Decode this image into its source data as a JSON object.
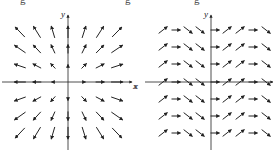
{
  "top_cut_text": [
    "g",
    "g",
    "g"
  ],
  "diagrams": [
    {
      "id": "left",
      "description": "Vector field radiating outward from origin",
      "field": "radial outward F(x,y) = (x, y)",
      "x_label": "x",
      "y_label": "y",
      "origin": [
        68,
        82
      ],
      "x_axis": [
        2,
        132
      ],
      "y_axis": [
        15,
        150
      ],
      "grid_x": [
        20,
        37,
        53,
        68,
        84,
        100,
        117
      ],
      "grid_y": [
        32,
        49,
        66,
        82,
        99,
        116,
        133
      ],
      "arrow_color": "#222222"
    },
    {
      "id": "right",
      "description": "Vector field with constant horizontal component, vertical component varying periodically with x",
      "field": "F(x,y) = (1, sin x)",
      "x_label": "x",
      "y_label": "y",
      "origin": [
        211,
        82
      ],
      "x_axis": [
        145,
        273
      ],
      "y_axis": [
        15,
        150
      ],
      "grid_x": [
        163,
        176,
        188,
        200,
        215,
        227,
        240,
        253,
        266
      ],
      "column_slopes": [
        -1,
        0,
        1,
        1,
        0,
        -1,
        -1,
        0,
        1
      ],
      "grid_y": [
        30,
        47,
        64,
        82,
        99,
        116,
        133
      ],
      "arrow_color": "#222222"
    }
  ]
}
